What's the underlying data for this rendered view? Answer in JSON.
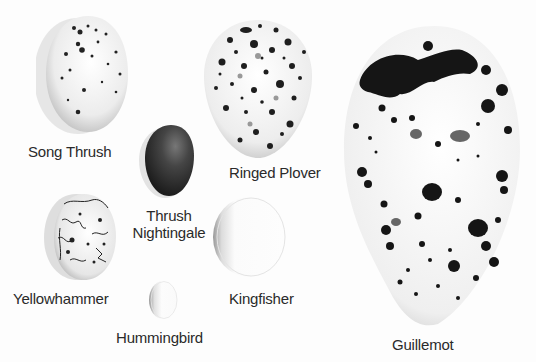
{
  "eggs": [
    {
      "id": "song-thrush",
      "label": "Song Thrush",
      "color": "#efefef",
      "spots": "small-sparse"
    },
    {
      "id": "ringed-plover",
      "label": "Ringed Plover",
      "color": "#efefef",
      "spots": "dense-speckled"
    },
    {
      "id": "guillemot",
      "label": "Guillemot",
      "color": "#f2f2f2",
      "spots": "large-blotched"
    },
    {
      "id": "thrush-nightingale",
      "label_line1": "Thrush",
      "label_line2": "Nightingale",
      "color": "#3a3a3a",
      "spots": "none"
    },
    {
      "id": "yellowhammer",
      "label": "Yellowhammer",
      "color": "#ebebeb",
      "spots": "scribbled"
    },
    {
      "id": "kingfisher",
      "label": "Kingfisher",
      "color": "#fafafa",
      "spots": "none"
    },
    {
      "id": "hummingbird",
      "label": "Hummingbird",
      "color": "#f8f8f8",
      "spots": "none"
    }
  ]
}
